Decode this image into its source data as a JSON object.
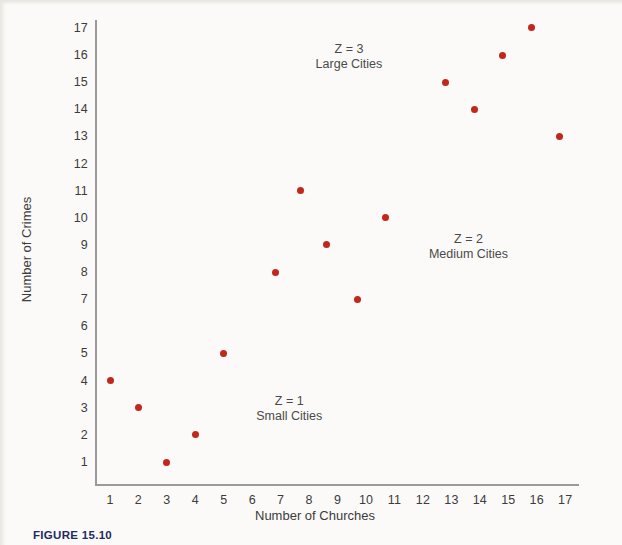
{
  "figure": {
    "caption": "FIGURE 15.10"
  },
  "chart_data": {
    "type": "scatter",
    "title": "",
    "xlabel": "Number of Churches",
    "ylabel": "Number of Crimes",
    "xlim": [
      0,
      17.8
    ],
    "ylim": [
      0,
      17.8
    ],
    "grid": false,
    "legend_position": "none",
    "xticks": [
      1,
      2,
      3,
      4,
      5,
      6,
      7,
      8,
      9,
      10,
      11,
      12,
      13,
      14,
      15,
      16,
      17
    ],
    "yticks": [
      1,
      2,
      3,
      4,
      5,
      6,
      7,
      8,
      9,
      10,
      11,
      12,
      13,
      14,
      15,
      16,
      17
    ],
    "point_color": "#c1271a",
    "series": [
      {
        "name": "Z = 1 Small Cities",
        "group": 1,
        "points": [
          {
            "x": 1,
            "y": 4
          },
          {
            "x": 2,
            "y": 3
          },
          {
            "x": 3,
            "y": 1
          },
          {
            "x": 4,
            "y": 2
          },
          {
            "x": 5,
            "y": 5
          }
        ]
      },
      {
        "name": "Z = 2 Medium Cities",
        "group": 2,
        "points": [
          {
            "x": 6.8,
            "y": 8
          },
          {
            "x": 7.7,
            "y": 11
          },
          {
            "x": 8.6,
            "y": 9
          },
          {
            "x": 9.7,
            "y": 7
          },
          {
            "x": 10.7,
            "y": 10
          }
        ]
      },
      {
        "name": "Z = 3 Large Cities",
        "group": 3,
        "points": [
          {
            "x": 12.8,
            "y": 15
          },
          {
            "x": 13.8,
            "y": 14
          },
          {
            "x": 14.8,
            "y": 16
          },
          {
            "x": 15.8,
            "y": 17
          },
          {
            "x": 16.8,
            "y": 13
          }
        ]
      }
    ],
    "annotations": [
      {
        "name": "small-cities",
        "z_text": "Z = 1",
        "group_text": "Small Cities",
        "x": 7.3,
        "y": 3.2
      },
      {
        "name": "medium-cities",
        "z_text": "Z = 2",
        "group_text": "Medium Cities",
        "x": 13.6,
        "y": 9.2
      },
      {
        "name": "large-cities",
        "z_text": "Z = 3",
        "group_text": "Large Cities",
        "x": 9.4,
        "y": 16.2
      }
    ]
  }
}
